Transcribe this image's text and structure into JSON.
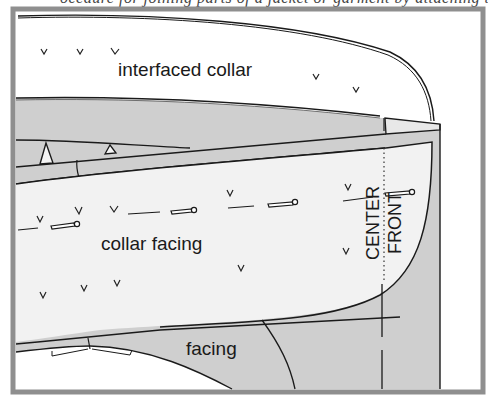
{
  "header": {
    "cutoff_caption": "ocedure for joining parts of a jacket or garment by attaching the facing"
  },
  "figure": {
    "frame_color": "#8f8f8f",
    "shade_color": "#cfcfcf",
    "light_color": "#f1f1f1",
    "line_color": "#1a1a1a",
    "labels": {
      "interfaced_collar": "interfaced collar",
      "collar_facing": "collar facing",
      "facing": "facing",
      "center": "CENTER",
      "front": "FRONT"
    }
  }
}
